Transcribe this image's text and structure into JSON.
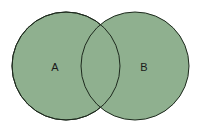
{
  "diagram": {
    "type": "venn",
    "fill_color": "#8fb08f",
    "stroke_color": "#1e2a1e",
    "sets": [
      {
        "label": "A",
        "cx": 66,
        "cy": 66,
        "r": 54
      },
      {
        "label": "B",
        "cx": 135,
        "cy": 66,
        "r": 54
      }
    ]
  }
}
